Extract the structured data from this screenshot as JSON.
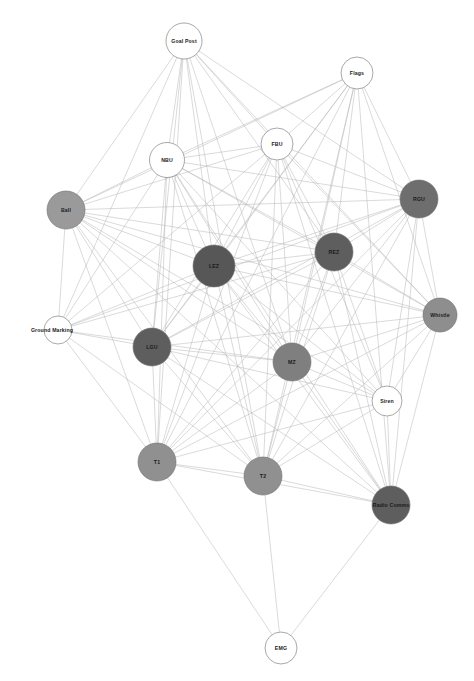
{
  "graph": {
    "title": "Network Graph",
    "type": "node-link-diagram",
    "width": 474,
    "height": 681,
    "background_color": "#ffffff",
    "edge_color": "#b4b4b4",
    "edge_width": 0.5,
    "label_color": "#1a1a1a",
    "node_stroke_color": "#6e6e6e",
    "shades": {
      "white": "#ffffff",
      "light_gray": "#9a9a9a",
      "medium_gray": "#8e8e8e",
      "dark_gray": "#575757"
    },
    "nodes": [
      {
        "id": "goal_post",
        "label": "Goal Post",
        "x": 184,
        "y": 41,
        "r": 18,
        "fill": "#ffffff",
        "label_dx": 0,
        "label_dy": 0
      },
      {
        "id": "flags",
        "label": "Flags",
        "x": 357,
        "y": 73,
        "r": 16,
        "fill": "#ffffff",
        "label_dx": 0,
        "label_dy": 0
      },
      {
        "id": "fbu",
        "label": "FBU",
        "x": 277,
        "y": 144,
        "r": 16,
        "fill": "#ffffff",
        "label_dx": 0,
        "label_dy": 0
      },
      {
        "id": "nbu",
        "label": "NBU",
        "x": 167,
        "y": 160,
        "r": 17.5,
        "fill": "#ffffff",
        "label_dx": 0,
        "label_dy": 0
      },
      {
        "id": "rgu",
        "label": "RGU",
        "x": 419,
        "y": 199,
        "r": 19,
        "fill": "#6e6e6e",
        "label_dx": 0,
        "label_dy": 0
      },
      {
        "id": "ball",
        "label": "Ball",
        "x": 66,
        "y": 210,
        "r": 19,
        "fill": "#9a9a9a",
        "label_dx": 0,
        "label_dy": 0
      },
      {
        "id": "rez",
        "label": "REZ",
        "x": 334,
        "y": 252,
        "r": 19,
        "fill": "#5e5e5e",
        "label_dx": 0,
        "label_dy": 0
      },
      {
        "id": "lez",
        "label": "LEZ",
        "x": 214,
        "y": 266,
        "r": 21,
        "fill": "#575757",
        "label_dx": 0,
        "label_dy": 0
      },
      {
        "id": "whistle",
        "label": "Whistle",
        "x": 440,
        "y": 315,
        "r": 17,
        "fill": "#8e8e8e",
        "label_dx": 0,
        "label_dy": 0
      },
      {
        "id": "ground_marking",
        "label": "Ground Marking",
        "x": 58,
        "y": 330,
        "r": 14,
        "fill": "#ffffff",
        "label_dx": -6,
        "label_dy": 0
      },
      {
        "id": "lgu",
        "label": "LGU",
        "x": 152,
        "y": 347,
        "r": 19,
        "fill": "#5e5e5e",
        "label_dx": 0,
        "label_dy": 0
      },
      {
        "id": "mz",
        "label": "MZ",
        "x": 292,
        "y": 362,
        "r": 19,
        "fill": "#7f7f7f",
        "label_dx": 0,
        "label_dy": 0
      },
      {
        "id": "siren",
        "label": "Siren",
        "x": 387,
        "y": 401,
        "r": 15,
        "fill": "#ffffff",
        "label_dx": 0,
        "label_dy": 0
      },
      {
        "id": "t1",
        "label": "T1",
        "x": 157,
        "y": 462,
        "r": 19,
        "fill": "#909090",
        "label_dx": 0,
        "label_dy": 0
      },
      {
        "id": "t2",
        "label": "T2",
        "x": 263,
        "y": 476,
        "r": 19,
        "fill": "#909090",
        "label_dx": 0,
        "label_dy": 0
      },
      {
        "id": "radio_comms",
        "label": "Radio Comms",
        "x": 391,
        "y": 505,
        "r": 19,
        "fill": "#5e5e5e",
        "label_dx": 0,
        "label_dy": 0
      },
      {
        "id": "emg",
        "label": "EMG",
        "x": 281,
        "y": 648,
        "r": 16,
        "fill": "#ffffff",
        "label_dx": 0,
        "label_dy": 0
      }
    ],
    "edges": [
      [
        "goal_post",
        "ball"
      ],
      [
        "goal_post",
        "nbu"
      ],
      [
        "goal_post",
        "fbu"
      ],
      [
        "goal_post",
        "lez"
      ],
      [
        "goal_post",
        "rez"
      ],
      [
        "goal_post",
        "rgu"
      ],
      [
        "goal_post",
        "lgu"
      ],
      [
        "goal_post",
        "mz"
      ],
      [
        "goal_post",
        "whistle"
      ],
      [
        "goal_post",
        "t1"
      ],
      [
        "goal_post",
        "t2"
      ],
      [
        "goal_post",
        "ground_marking"
      ],
      [
        "flags",
        "nbu"
      ],
      [
        "flags",
        "fbu"
      ],
      [
        "flags",
        "ball"
      ],
      [
        "flags",
        "lez"
      ],
      [
        "flags",
        "rez"
      ],
      [
        "flags",
        "rgu"
      ],
      [
        "flags",
        "lgu"
      ],
      [
        "flags",
        "mz"
      ],
      [
        "flags",
        "t1"
      ],
      [
        "flags",
        "t2"
      ],
      [
        "flags",
        "radio_comms"
      ],
      [
        "flags",
        "whistle"
      ],
      [
        "fbu",
        "nbu"
      ],
      [
        "fbu",
        "ball"
      ],
      [
        "fbu",
        "lez"
      ],
      [
        "fbu",
        "rez"
      ],
      [
        "fbu",
        "rgu"
      ],
      [
        "fbu",
        "lgu"
      ],
      [
        "fbu",
        "mz"
      ],
      [
        "fbu",
        "t1"
      ],
      [
        "fbu",
        "t2"
      ],
      [
        "fbu",
        "whistle"
      ],
      [
        "fbu",
        "siren"
      ],
      [
        "fbu",
        "radio_comms"
      ],
      [
        "fbu",
        "ground_marking"
      ],
      [
        "nbu",
        "ball"
      ],
      [
        "nbu",
        "lez"
      ],
      [
        "nbu",
        "rez"
      ],
      [
        "nbu",
        "rgu"
      ],
      [
        "nbu",
        "lgu"
      ],
      [
        "nbu",
        "mz"
      ],
      [
        "nbu",
        "t1"
      ],
      [
        "nbu",
        "t2"
      ],
      [
        "nbu",
        "whistle"
      ],
      [
        "nbu",
        "siren"
      ],
      [
        "nbu",
        "radio_comms"
      ],
      [
        "nbu",
        "ground_marking"
      ],
      [
        "ball",
        "lez"
      ],
      [
        "ball",
        "rez"
      ],
      [
        "ball",
        "rgu"
      ],
      [
        "ball",
        "lgu"
      ],
      [
        "ball",
        "mz"
      ],
      [
        "ball",
        "t1"
      ],
      [
        "ball",
        "t2"
      ],
      [
        "ball",
        "whistle"
      ],
      [
        "ball",
        "siren"
      ],
      [
        "ball",
        "radio_comms"
      ],
      [
        "ball",
        "ground_marking"
      ],
      [
        "rgu",
        "lez"
      ],
      [
        "rgu",
        "rez"
      ],
      [
        "rgu",
        "lgu"
      ],
      [
        "rgu",
        "mz"
      ],
      [
        "rgu",
        "t1"
      ],
      [
        "rgu",
        "t2"
      ],
      [
        "rgu",
        "whistle"
      ],
      [
        "rgu",
        "siren"
      ],
      [
        "rgu",
        "radio_comms"
      ],
      [
        "rgu",
        "ground_marking"
      ],
      [
        "rez",
        "lez"
      ],
      [
        "rez",
        "lgu"
      ],
      [
        "rez",
        "mz"
      ],
      [
        "rez",
        "t1"
      ],
      [
        "rez",
        "t2"
      ],
      [
        "rez",
        "whistle"
      ],
      [
        "rez",
        "siren"
      ],
      [
        "rez",
        "radio_comms"
      ],
      [
        "rez",
        "ground_marking"
      ],
      [
        "lez",
        "lgu"
      ],
      [
        "lez",
        "mz"
      ],
      [
        "lez",
        "t1"
      ],
      [
        "lez",
        "t2"
      ],
      [
        "lez",
        "whistle"
      ],
      [
        "lez",
        "siren"
      ],
      [
        "lez",
        "radio_comms"
      ],
      [
        "lez",
        "ground_marking"
      ],
      [
        "whistle",
        "lgu"
      ],
      [
        "whistle",
        "mz"
      ],
      [
        "whistle",
        "t1"
      ],
      [
        "whistle",
        "t2"
      ],
      [
        "whistle",
        "siren"
      ],
      [
        "whistle",
        "radio_comms"
      ],
      [
        "ground_marking",
        "lgu"
      ],
      [
        "ground_marking",
        "mz"
      ],
      [
        "ground_marking",
        "t1"
      ],
      [
        "ground_marking",
        "t2"
      ],
      [
        "lgu",
        "mz"
      ],
      [
        "lgu",
        "t1"
      ],
      [
        "lgu",
        "t2"
      ],
      [
        "lgu",
        "siren"
      ],
      [
        "lgu",
        "radio_comms"
      ],
      [
        "mz",
        "t1"
      ],
      [
        "mz",
        "t2"
      ],
      [
        "mz",
        "siren"
      ],
      [
        "mz",
        "radio_comms"
      ],
      [
        "siren",
        "t1"
      ],
      [
        "siren",
        "t2"
      ],
      [
        "siren",
        "radio_comms"
      ],
      [
        "t1",
        "t2"
      ],
      [
        "t1",
        "radio_comms"
      ],
      [
        "t1",
        "emg"
      ],
      [
        "t2",
        "radio_comms"
      ],
      [
        "t2",
        "emg"
      ],
      [
        "radio_comms",
        "emg"
      ]
    ]
  }
}
